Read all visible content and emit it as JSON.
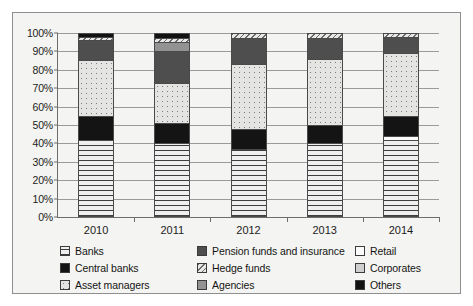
{
  "chart_data": {
    "type": "bar",
    "title": "",
    "subtitle": "",
    "xlabel": "",
    "ylabel": "",
    "stacked": true,
    "normalized_percent": true,
    "grid": true,
    "legend_position": "bottom",
    "ylim": [
      0,
      100
    ],
    "ytick_labels": [
      "0%",
      "10%",
      "20%",
      "30%",
      "40%",
      "50%",
      "60%",
      "70%",
      "80%",
      "90%",
      "100%"
    ],
    "ytick_values": [
      0,
      10,
      20,
      30,
      40,
      50,
      60,
      70,
      80,
      90,
      100
    ],
    "categories": [
      "2010",
      "2011",
      "2012",
      "2013",
      "2014"
    ],
    "series": [
      {
        "name": "Banks",
        "pattern": "horizontal-dash-hatch",
        "color": "#efefef",
        "values": [
          41,
          39,
          36,
          39,
          41
        ]
      },
      {
        "name": "Retail",
        "pattern": "solid-white",
        "color": "#fbfbfb",
        "values": [
          0,
          0,
          0,
          0,
          2
        ]
      },
      {
        "name": "Central banks",
        "pattern": "solid-black",
        "color": "#141414",
        "values": [
          13,
          11,
          11,
          10,
          11
        ]
      },
      {
        "name": "Asset managers",
        "pattern": "fine-dotted",
        "color": "#e4e4e2",
        "values": [
          30,
          22,
          35,
          36,
          34
        ]
      },
      {
        "name": "Pension funds and insurance",
        "pattern": "solid-dark-gray",
        "color": "#4e4e4e",
        "values": [
          11,
          17,
          14,
          11,
          9
        ]
      },
      {
        "name": "Agencies",
        "pattern": "solid-mid-gray",
        "color": "#939393",
        "values": [
          0,
          5,
          0,
          0,
          0
        ]
      },
      {
        "name": "Hedge funds",
        "pattern": "diagonal-hatch",
        "color": "#e8e8e6",
        "values": [
          2,
          2,
          3,
          3,
          3
        ]
      },
      {
        "name": "Corporates",
        "pattern": "solid-light-gray",
        "color": "#cfcfcf",
        "values": [
          0,
          0,
          0,
          0,
          0
        ]
      },
      {
        "name": "Others",
        "pattern": "solid-black",
        "color": "#121212",
        "values": [
          3,
          4,
          1,
          1,
          0
        ]
      }
    ]
  },
  "legend": {
    "columns": [
      {
        "items": [
          {
            "label": "Banks",
            "swatch": "p-banks"
          },
          {
            "label": "Central banks",
            "swatch": "p-central"
          },
          {
            "label": "Asset managers",
            "swatch": "p-asset"
          }
        ]
      },
      {
        "items": [
          {
            "label": "Pension funds and insurance",
            "swatch": "p-pension"
          },
          {
            "label": "Hedge funds",
            "swatch": "p-hedge"
          },
          {
            "label": "Agencies",
            "swatch": "p-agencies"
          }
        ]
      },
      {
        "items": [
          {
            "label": "Retail",
            "swatch": "p-retail"
          },
          {
            "label": "Corporates",
            "swatch": "p-corporates"
          },
          {
            "label": "Others",
            "swatch": "p-others"
          }
        ]
      }
    ]
  },
  "colors": {
    "background": "#f4f4f2",
    "axis": "#6d6d6d",
    "grid": "#9a9a9a",
    "frame": "#8e8e8e",
    "text": "#1c1c1c"
  }
}
